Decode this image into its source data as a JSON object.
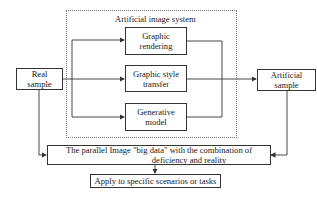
{
  "diagram": {
    "system": {
      "title": "Artificial image system",
      "methods": [
        {
          "label": "Graphic rendering",
          "line1": "Graphic",
          "line2": "rendering"
        },
        {
          "label": "Graphic style transfer",
          "line1": "Graphic style",
          "line2": "transfer"
        },
        {
          "label": "Generative model",
          "line1": "Generative",
          "line2": "model"
        }
      ]
    },
    "inputs": {
      "real": {
        "line1": "Real",
        "line2": "sample"
      },
      "artificial": {
        "line1": "Artificial",
        "line2": "sample"
      }
    },
    "big_data": {
      "line1": "The parallel Image \"big data\" with the combination of",
      "line2": "deficiency and reality"
    },
    "apply": {
      "label": "Apply to specific scenarios or tasks"
    },
    "colors": {
      "line": "#333333",
      "dotted_border": "#777777",
      "background": "#ffffff"
    }
  }
}
